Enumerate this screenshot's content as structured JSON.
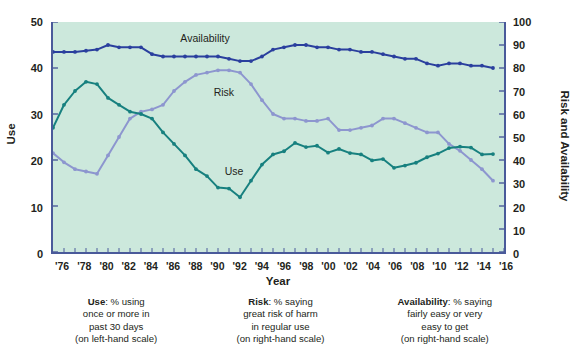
{
  "chart_data": {
    "type": "line",
    "title": "",
    "xlabel": "Year",
    "ylabel_left": "Use",
    "ylabel_right": "Risk and Availability",
    "xlim": [
      1975,
      2016
    ],
    "ylim_left": [
      0,
      50
    ],
    "ylim_right": [
      0,
      100
    ],
    "grid": false,
    "legend_position": "inline-labels",
    "x_tick_labels": [
      "'76",
      "'78",
      "'80",
      "'82",
      "'84",
      "'86",
      "'88",
      "'90",
      "'92",
      "'94",
      "'96",
      "'98",
      "'00",
      "'02",
      "'04",
      "'06",
      "'08",
      "'10",
      "'12",
      "'14",
      "'16"
    ],
    "x_tick_values": [
      1976,
      1978,
      1980,
      1982,
      1984,
      1986,
      1988,
      1990,
      1992,
      1994,
      1996,
      1998,
      2000,
      2002,
      2004,
      2006,
      2008,
      2010,
      2012,
      2014,
      2016
    ],
    "y_left_tick_labels": [
      "0",
      "10",
      "20",
      "30",
      "40",
      "50"
    ],
    "y_left_tick_values": [
      0,
      10,
      20,
      30,
      40,
      50
    ],
    "y_right_tick_labels": [
      "0",
      "10",
      "20",
      "30",
      "40",
      "50",
      "60",
      "70",
      "80",
      "90",
      "100"
    ],
    "y_right_tick_values": [
      0,
      10,
      20,
      30,
      40,
      50,
      60,
      70,
      80,
      90,
      100
    ],
    "x": [
      1975,
      1976,
      1977,
      1978,
      1979,
      1980,
      1981,
      1982,
      1983,
      1984,
      1985,
      1986,
      1987,
      1988,
      1989,
      1990,
      1991,
      1992,
      1993,
      1994,
      1995,
      1996,
      1997,
      1998,
      1999,
      2000,
      2001,
      2002,
      2003,
      2004,
      2005,
      2006,
      2007,
      2008,
      2009,
      2010,
      2011,
      2012,
      2013,
      2014,
      2015
    ],
    "series": [
      {
        "name": "Availability",
        "axis": "right",
        "color": "#2a3f9e",
        "values": [
          87,
          87,
          87,
          87.5,
          88,
          90,
          89,
          89,
          89,
          86,
          85,
          85,
          85,
          85,
          85,
          85,
          84,
          83,
          83,
          85,
          88,
          89,
          90,
          90,
          89,
          89,
          88,
          88,
          87,
          87,
          86,
          85,
          84,
          84,
          82,
          81,
          82,
          82,
          81,
          81,
          80
        ]
      },
      {
        "name": "Risk",
        "axis": "right",
        "color": "#8d96cf",
        "values": [
          43,
          39,
          36,
          35,
          34,
          42,
          50,
          58,
          61,
          62,
          64,
          70,
          74,
          77,
          78,
          79,
          79,
          78,
          73,
          66,
          60,
          58,
          58,
          57,
          57,
          58,
          53,
          53,
          54,
          55,
          58,
          58,
          56,
          54,
          52,
          52,
          47,
          44,
          40,
          36,
          31
        ]
      },
      {
        "name": "Use",
        "axis": "left",
        "color": "#17807f",
        "values": [
          27,
          32,
          35,
          37,
          36.5,
          33.5,
          32,
          30.5,
          30,
          29,
          26,
          23.5,
          21,
          18,
          16.5,
          14,
          13.8,
          11.9,
          15.5,
          19,
          21.2,
          21.9,
          23.7,
          22.8,
          23.1,
          21.6,
          22.4,
          21.5,
          21.2,
          19.9,
          20.2,
          18.3,
          18.8,
          19.4,
          20.6,
          21.4,
          22.6,
          22.9,
          22.7,
          21.2,
          21.3
        ]
      }
    ],
    "annotations": [
      {
        "text": "Availability",
        "x": 1989,
        "y_right": 93
      },
      {
        "text": "Risk",
        "x": 1992,
        "y_right": 70
      },
      {
        "text": "Use",
        "x": 1993,
        "y_left": 17.8
      }
    ]
  },
  "captions": [
    {
      "term": "Use",
      "lines": [
        ": % using",
        "once or more in",
        "past 30 days",
        "(on left-hand scale)"
      ]
    },
    {
      "term": "Risk",
      "lines": [
        ": % saying",
        "great risk of harm",
        "in regular use",
        "(on right-hand scale)"
      ]
    },
    {
      "term": "Availability",
      "lines": [
        ": % saying",
        "fairly easy or very",
        "easy to get",
        "(on right-hand scale)"
      ]
    }
  ],
  "colors": {
    "plot_background": "#cce8dc",
    "page_background": "#ffffff",
    "axis": "#4a5a9a",
    "text": "#231f20",
    "availability": "#2a3f9e",
    "risk": "#8d96cf",
    "use": "#17807f"
  }
}
